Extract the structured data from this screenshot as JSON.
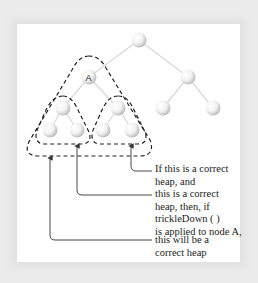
{
  "diagram": {
    "node_label_A": "A",
    "captions": {
      "c1": [
        "If this is a correct",
        "heap, and"
      ],
      "c2": [
        "this is a correct",
        "heap, then, if",
        "trickleDown ( )",
        "is applied to node A,"
      ],
      "c3": [
        "this will be a",
        "correct heap"
      ]
    },
    "colors": {
      "node_fill": "#e8e8e8",
      "edge": "#d8d8d8",
      "dashed_outline": "#222222",
      "arrow": "#333333",
      "panel": "#ffffff",
      "background": "#ececec"
    }
  }
}
